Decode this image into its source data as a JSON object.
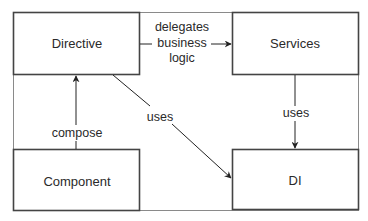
{
  "diagram": {
    "nodes": [
      {
        "id": "directive",
        "label": "Directive"
      },
      {
        "id": "services",
        "label": "Services"
      },
      {
        "id": "component",
        "label": "Component"
      },
      {
        "id": "di",
        "label": "DI"
      }
    ],
    "edges": [
      {
        "from": "directive",
        "to": "services",
        "label_lines": [
          "delegates",
          "business",
          "logic"
        ]
      },
      {
        "from": "component",
        "to": "directive",
        "label": "compose"
      },
      {
        "from": "directive",
        "to": "di",
        "label": "uses"
      },
      {
        "from": "services",
        "to": "di",
        "label": "uses"
      }
    ]
  }
}
